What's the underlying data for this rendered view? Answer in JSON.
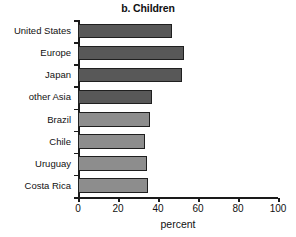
{
  "chart_data": {
    "type": "bar",
    "orientation": "horizontal",
    "title": "b. Children",
    "xlabel": "percent",
    "ylabel": "",
    "xlim": [
      0,
      100
    ],
    "xticks": [
      0,
      20,
      40,
      60,
      80,
      100
    ],
    "grid": false,
    "legend": null,
    "categories": [
      "United States",
      "Europe",
      "Japan",
      "other Asia",
      "Brazil",
      "Chile",
      "Uruguay",
      "Costa Rica"
    ],
    "values": [
      47,
      53,
      52,
      37,
      36,
      33.5,
      34.5,
      35
    ],
    "bar_colors": [
      "#585858",
      "#585858",
      "#585858",
      "#585858",
      "#8d8d8d",
      "#8d8d8d",
      "#8d8d8d",
      "#8d8d8d"
    ],
    "bar_edge_color": "#1f1f1f"
  }
}
